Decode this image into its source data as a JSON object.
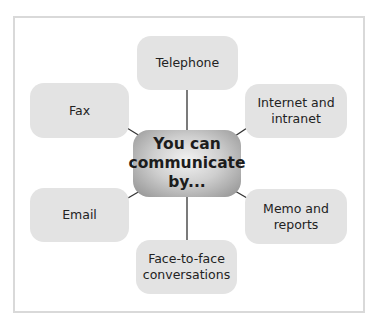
{
  "diagram": {
    "type": "mind-map",
    "center": {
      "lines": [
        "You can",
        "communicate",
        "by..."
      ]
    },
    "nodes": [
      {
        "id": "telephone",
        "lines": [
          "Telephone"
        ]
      },
      {
        "id": "fax",
        "lines": [
          "Fax"
        ]
      },
      {
        "id": "internet",
        "lines": [
          "Internet and",
          "intranet"
        ]
      },
      {
        "id": "email",
        "lines": [
          "Email"
        ]
      },
      {
        "id": "memo",
        "lines": [
          "Memo and",
          "reports"
        ]
      },
      {
        "id": "face",
        "lines": [
          "Face-to-face",
          "conversations"
        ]
      }
    ],
    "colors": {
      "node_fill": "#e3e3e3",
      "frame_border": "#d9d9d9",
      "connector": "#333333"
    }
  }
}
